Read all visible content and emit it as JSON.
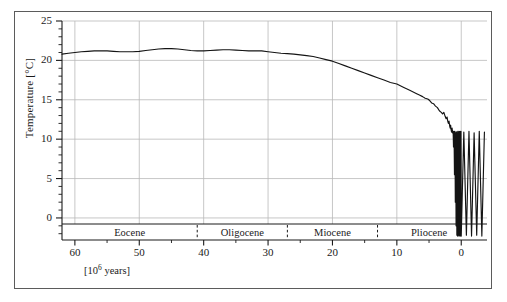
{
  "figure": {
    "background_color": "#ffffff",
    "frame_color": "#5b5b5b",
    "grid_color": "#b9b9b9",
    "curve_color": "#141414"
  },
  "chart_data": {
    "type": "line",
    "title": "",
    "subtitle": "",
    "xlabel": "[10⁶ years]",
    "ylabel": "Temperature [°C]",
    "xlim": [
      62,
      -4
    ],
    "ylim": [
      -2.8,
      25
    ],
    "x_inverted": true,
    "grid": true,
    "grid_axes": "both",
    "legend": "none",
    "y_major_ticks": [
      0,
      5,
      10,
      15,
      20,
      25
    ],
    "y_minor_tick_step": 1,
    "y_tick_labels": [
      "0",
      "5",
      "10",
      "15",
      "20",
      "25"
    ],
    "x_major_ticks": [
      60,
      50,
      40,
      30,
      20,
      10,
      0
    ],
    "x_minor_tick_step": 5,
    "x_tick_labels": [
      "60",
      "50",
      "40",
      "30",
      "20",
      "10",
      "0"
    ],
    "annotations": [
      {
        "type": "epoch-band",
        "label": "Eocene",
        "x_start": 62,
        "x_end": 41,
        "center": 51.5
      },
      {
        "type": "epoch-band",
        "label": "Oligocene",
        "x_start": 41,
        "x_end": 27,
        "center": 34
      },
      {
        "type": "epoch-band",
        "label": "Miocene",
        "x_start": 27,
        "x_end": 13,
        "center": 20
      },
      {
        "type": "epoch-band",
        "label": "Pliocene",
        "x_start": 13,
        "x_end": -4,
        "center": 5
      }
    ],
    "epoch_boundaries_myr": [
      41,
      27,
      13
    ],
    "series": [
      {
        "name": "Global mean temperature",
        "x": [
          62.0,
          61.0,
          60.0,
          59.0,
          58.0,
          57.0,
          56.0,
          55.0,
          54.0,
          53.0,
          52.0,
          51.0,
          50.0,
          49.0,
          48.0,
          47.0,
          46.0,
          45.0,
          44.0,
          43.0,
          42.0,
          41.0,
          40.0,
          39.0,
          38.0,
          37.0,
          36.0,
          35.0,
          34.0,
          33.0,
          32.0,
          31.0,
          30.0,
          29.0,
          28.0,
          27.0,
          26.0,
          25.0,
          24.0,
          23.0,
          22.0,
          21.0,
          20.0,
          19.0,
          18.0,
          17.0,
          16.0,
          15.0,
          14.0,
          13.0,
          12.0,
          11.0,
          10.0,
          9.0,
          8.0,
          7.0,
          6.5,
          6.0,
          5.6,
          5.2,
          4.9,
          4.6,
          4.3,
          4.0,
          3.7,
          3.4,
          3.1,
          2.9,
          2.7,
          2.5,
          2.35,
          2.2,
          2.1,
          2.0,
          1.9,
          1.8,
          1.72,
          1.65,
          1.58,
          1.5,
          1.42,
          1.34,
          1.26,
          1.2,
          1.12,
          1.05,
          0.98,
          0.92,
          0.86,
          0.8,
          0.74,
          0.68,
          0.62,
          0.56,
          0.5,
          0.45,
          0.4,
          0.35,
          0.3,
          0.25,
          0.2,
          0.16,
          0.12,
          0.08,
          0.04,
          0.0,
          -0.4,
          -0.8,
          -1.2,
          -1.6,
          -2.0,
          -2.4,
          -2.8,
          -3.2,
          -3.6
        ],
        "y": [
          20.8,
          20.9,
          21.0,
          21.1,
          21.15,
          21.2,
          21.2,
          21.2,
          21.15,
          21.1,
          21.1,
          21.1,
          21.15,
          21.25,
          21.35,
          21.45,
          21.5,
          21.5,
          21.45,
          21.35,
          21.25,
          21.2,
          21.2,
          21.25,
          21.3,
          21.35,
          21.35,
          21.3,
          21.25,
          21.2,
          21.2,
          21.2,
          21.1,
          21.0,
          20.9,
          20.85,
          20.8,
          20.7,
          20.6,
          20.5,
          20.3,
          20.1,
          19.9,
          19.6,
          19.3,
          19.0,
          18.7,
          18.4,
          18.1,
          17.8,
          17.5,
          17.2,
          17.0,
          16.6,
          16.2,
          15.8,
          15.6,
          15.4,
          15.2,
          15.1,
          14.9,
          14.6,
          14.5,
          14.2,
          14.0,
          13.6,
          13.4,
          13.2,
          13.4,
          12.9,
          12.6,
          12.8,
          12.3,
          12.0,
          12.3,
          11.7,
          11.4,
          11.8,
          11.2,
          10.9,
          11.4,
          10.8,
          11.0,
          9.0,
          11.0,
          5.5,
          11.0,
          2.0,
          10.8,
          -1.0,
          10.9,
          -2.2,
          11.0,
          -2.3,
          10.8,
          -2.2,
          11.0,
          -2.3,
          10.9,
          -2.2,
          11.0,
          -2.3,
          10.8,
          -2.2,
          11.0,
          -2.3,
          10.9,
          -2.2,
          11.0,
          -2.3,
          10.8,
          -2.2,
          11.0,
          -2.3,
          10.9
        ],
        "description": "Cenozoic global temperature decline with Pleistocene glacial-interglacial oscillations"
      }
    ]
  }
}
